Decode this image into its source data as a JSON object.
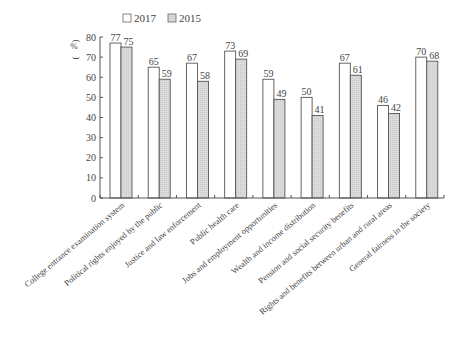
{
  "chart_data": {
    "type": "bar",
    "title": "",
    "xlabel": "",
    "ylabel": "(%)",
    "ylim": [
      0,
      80
    ],
    "yticks": [
      0,
      10,
      20,
      30,
      40,
      50,
      60,
      70,
      80
    ],
    "grid": false,
    "legend_position": "top",
    "categories": [
      "College entrance examination system",
      "Political rights enjoyed by the public",
      "Justice and law enforcement",
      "Public health care",
      "Jobs and employment opportunities",
      "Wealth and income distribution",
      "Pension and social security benefits",
      "Rights and benefits between urban and rural areas",
      "General fairness in the society"
    ],
    "series": [
      {
        "name": "2017",
        "color": "#ffffff",
        "values": [
          77,
          65,
          67,
          73,
          59,
          50,
          67,
          46,
          70
        ]
      },
      {
        "name": "2015",
        "color": "#d9d9d9",
        "values": [
          75,
          59,
          58,
          69,
          49,
          41,
          61,
          42,
          68
        ]
      }
    ]
  },
  "legend": {
    "items": [
      {
        "label": "2017",
        "swatch": "#ffffff"
      },
      {
        "label": "2015",
        "swatch": "#d9d9d9"
      }
    ]
  },
  "axis": {
    "y_label": "%"
  }
}
